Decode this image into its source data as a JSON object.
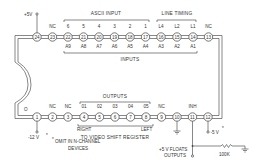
{
  "diagram": {
    "type": "IC pinout schematic",
    "top_row": {
      "pins": [
        {
          "num": "24",
          "above": "",
          "below": ""
        },
        {
          "num": "23",
          "above": "NC",
          "below": ""
        },
        {
          "num": "22",
          "above": "6",
          "below": "A9"
        },
        {
          "num": "21",
          "above": "5",
          "below": "A8"
        },
        {
          "num": "20",
          "above": "4",
          "below": "A7"
        },
        {
          "num": "19",
          "above": "3",
          "below": "A6"
        },
        {
          "num": "18",
          "above": "2",
          "below": "A5"
        },
        {
          "num": "17",
          "above": "1",
          "below": "A4"
        },
        {
          "num": "16",
          "above": "L4",
          "below": "A3"
        },
        {
          "num": "15",
          "above": "L2",
          "below": "A2"
        },
        {
          "num": "14",
          "above": "L1",
          "below": "A1"
        },
        {
          "num": "13",
          "above": "NC",
          "below": ""
        }
      ],
      "group_labels": {
        "ascii_input": "ASCII INPUT",
        "line_timing": "LINE TIMING",
        "inputs": "INPUTS"
      },
      "supply_label": "+5V"
    },
    "bottom_row": {
      "pins": [
        {
          "num": "1",
          "above": "",
          "below": ""
        },
        {
          "num": "2",
          "above": "NC",
          "below": ""
        },
        {
          "num": "3",
          "above": "NC",
          "below": ""
        },
        {
          "num": "4",
          "above": "01",
          "below": ""
        },
        {
          "num": "5",
          "above": "02",
          "below": ""
        },
        {
          "num": "6",
          "above": "03",
          "below": ""
        },
        {
          "num": "7",
          "above": "04",
          "below": ""
        },
        {
          "num": "8",
          "above": "05",
          "below": ""
        },
        {
          "num": "9",
          "above": "NC",
          "below": ""
        },
        {
          "num": "10",
          "above": "",
          "below": ""
        },
        {
          "num": "11",
          "above": "INH",
          "below": ""
        },
        {
          "num": "12",
          "above": "",
          "below": ""
        }
      ],
      "group_labels": {
        "outputs": "OUTPUTS",
        "right": "RIGHT",
        "left": "LEFT",
        "to_video": "TO VIDEO SHIFT REGISTER"
      },
      "pin1_top_label": "O",
      "minus12_label": "-12 V",
      "asterisk": "*",
      "footnote_line1": "OMIT IN N-CHANNEL",
      "footnote_line2": "DEVICES",
      "minus5_label": "-5 V",
      "floats_line1": "+5 V FLOATS",
      "floats_line2": "OUTPUTS",
      "resistor_label": "100K"
    }
  }
}
